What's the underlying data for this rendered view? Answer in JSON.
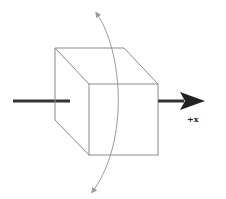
{
  "diagram": {
    "axis_label": "+x",
    "colors": {
      "background": "#ffffff",
      "cube_edges": "#8a8a8a",
      "axis": "#333333",
      "rotation_arc": "#9a9a9a"
    },
    "elements": [
      {
        "name": "cube",
        "description": "wireframe cube shown in oblique projection"
      },
      {
        "name": "x-axis",
        "description": "thick axis line passing through the cube, arrow pointing right"
      },
      {
        "name": "rotation-arrow",
        "description": "curved double-headed arrow indicating rotation about the x-axis"
      }
    ]
  }
}
